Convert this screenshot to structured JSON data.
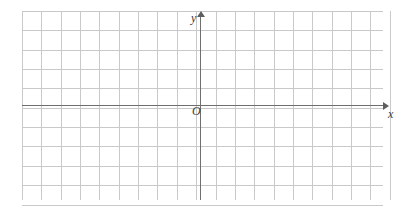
{
  "figure": {
    "type": "cartesian-coordinate-grid",
    "title": "",
    "background_color": "#ffffff",
    "grid_color": "#c9c9c9",
    "axis_color": "#6f6f6f",
    "label_color": "#3a3a3a"
  },
  "labels": {
    "y_axis": "y",
    "x_axis": "x",
    "origin": "O"
  },
  "icons": {
    "x_arrow": "arrow-right-icon",
    "y_arrow": "arrow-up-icon"
  },
  "chart_data": {
    "type": "scatter",
    "title": "",
    "xlabel": "x",
    "ylabel": "y",
    "series": [],
    "x": [],
    "values": [],
    "annotations": [
      "O"
    ],
    "grid": true,
    "legend": "none",
    "grid_columns": 19,
    "grid_rows": 10,
    "cell_size_px": 19.35,
    "origin_cell_col": 9,
    "origin_cell_row": 5,
    "xlim": [
      -9,
      10
    ],
    "ylim": [
      -5,
      5
    ]
  }
}
